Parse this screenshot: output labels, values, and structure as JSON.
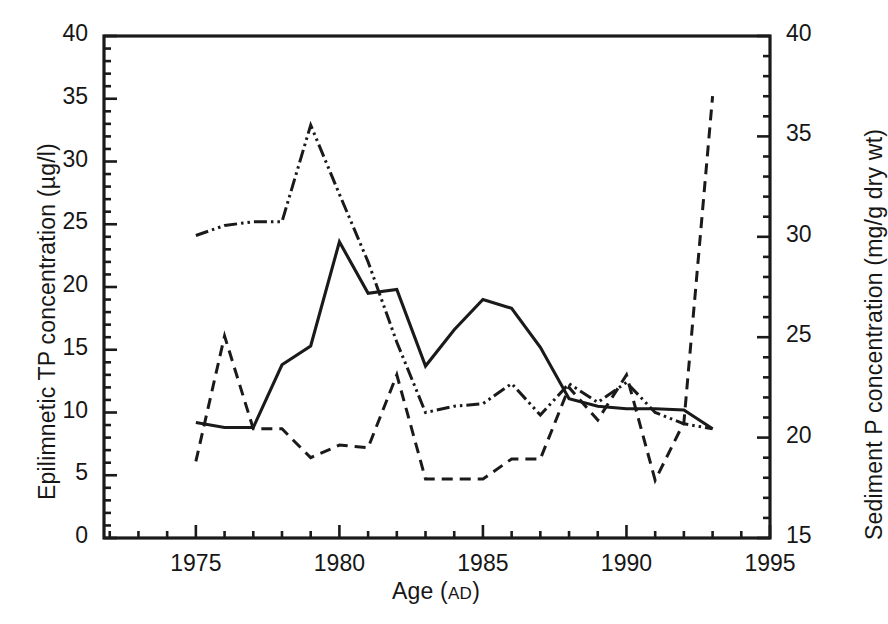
{
  "chart_data": {
    "type": "line",
    "title": "",
    "xlabel": "Age (AD)",
    "xlabel_parts": {
      "main": "Age (",
      "smallcaps": "AD",
      "close": ")"
    },
    "ylabel": "Epilimnetic TP concentration (µg/l)",
    "y2label": "Sediment P concentration (mg/g dry wt)",
    "xlim": [
      1971.8,
      1995.0
    ],
    "ylim": [
      0,
      40
    ],
    "y2lim": [
      15,
      40
    ],
    "grid": false,
    "legend": "none",
    "xticks": [
      1975,
      1980,
      1985,
      1990,
      1995
    ],
    "xticklabels": [
      "1975",
      "1980",
      "1985",
      "1990",
      "1995"
    ],
    "xminor_step": 1,
    "yticks": [
      0,
      5,
      10,
      15,
      20,
      25,
      30,
      35,
      40
    ],
    "yticklabels": [
      "0",
      "5",
      "10",
      "15",
      "20",
      "25",
      "30",
      "35",
      "40"
    ],
    "yminor_step": 1,
    "y2ticks": [
      15,
      20,
      25,
      30,
      35,
      40
    ],
    "y2ticklabels": [
      "15",
      "20",
      "25",
      "30",
      "35",
      "40"
    ],
    "y2minor_step": 1,
    "series": [
      {
        "name": "Epilimnetic TP concentration",
        "axis": "left",
        "style": "solid",
        "color": "#1a1a1a",
        "x": [
          1975,
          1976,
          1977,
          1978,
          1979,
          1980,
          1981,
          1982,
          1983,
          1984,
          1985,
          1986,
          1987,
          1988,
          1989,
          1990,
          1991,
          1992,
          1993
        ],
        "y": [
          9.2,
          8.8,
          8.8,
          13.8,
          15.3,
          23.6,
          19.5,
          19.8,
          13.7,
          16.6,
          19.0,
          18.3,
          15.2,
          11.1,
          10.5,
          10.3,
          10.3,
          10.2,
          8.7
        ]
      },
      {
        "name": "Sediment P concentration",
        "axis": "right",
        "style": "dash-dot-dot",
        "color": "#1a1a1a",
        "x": [
          1975,
          1976,
          1977,
          1978,
          1979,
          1980,
          1981,
          1982,
          1983,
          1984,
          1985,
          1986,
          1987,
          1988,
          1989,
          1990,
          1991,
          1992,
          1993
        ],
        "y_left_equiv": [
          24.1,
          24.9,
          25.2,
          25.2,
          32.9,
          27.4,
          22.0,
          15.6,
          10.0,
          10.5,
          10.7,
          12.3,
          9.8,
          12.3,
          10.8,
          12.4,
          10.0,
          9.1,
          8.7
        ],
        "y": [
          30.1,
          30.6,
          30.8,
          30.8,
          35.6,
          32.1,
          28.8,
          24.8,
          21.3,
          21.6,
          21.7,
          22.7,
          21.1,
          22.7,
          21.8,
          22.8,
          21.3,
          20.7,
          20.4
        ]
      },
      {
        "name": "Dashed record",
        "axis": "left",
        "style": "dashed",
        "color": "#1a1a1a",
        "x": [
          1975,
          1976,
          1977,
          1978,
          1979,
          1980,
          1981,
          1982,
          1983,
          1984,
          1985,
          1986,
          1987,
          1988,
          1989,
          1990,
          1991,
          1992,
          1993
        ],
        "y": [
          6.1,
          16.1,
          8.7,
          8.7,
          6.4,
          7.4,
          7.2,
          13.0,
          4.7,
          4.7,
          4.7,
          6.3,
          6.3,
          12.0,
          9.4,
          13.0,
          4.6,
          9.2,
          35.2
        ]
      }
    ]
  },
  "axes": {
    "y_left_title": "Epilimnetic TP concentration (µg/l)",
    "y_right_title": "Sediment P concentration (mg/g dry wt)",
    "x_title_main": "Age (",
    "x_title_small": "AD",
    "x_title_close": ")"
  },
  "colors": {
    "frame": "#1a1a1a",
    "ink": "#1a1a1a",
    "background": "#ffffff"
  }
}
